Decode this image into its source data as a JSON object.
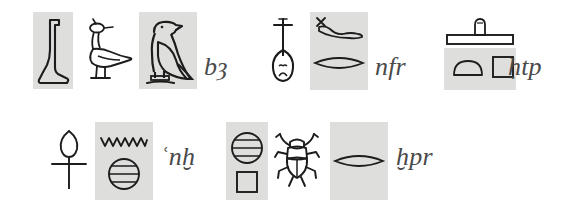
{
  "page": {
    "background_color": "#ffffff",
    "shade_color": "#dededd",
    "ink_color": "#1c1c1c",
    "translit_color": "#4a4a4a",
    "width": 570,
    "height": 210
  },
  "rows": [
    {
      "id": "row-top",
      "groups": [
        {
          "id": "group-ba",
          "transliteration": "bȜ",
          "translit_display": "bȝ",
          "translit_font_size": 26,
          "signs": [
            {
              "id": "sign-foot",
              "name": "foot-glyph",
              "phonetic": "b",
              "shaded": true
            },
            {
              "id": "sign-heron",
              "name": "heron-bird-glyph",
              "phonetic": "ȝ",
              "shaded": false
            },
            {
              "id": "sign-ba-bird",
              "name": "ba-bird-glyph",
              "phonetic": "bȝ",
              "shaded": true
            }
          ]
        },
        {
          "id": "group-nefer",
          "transliteration": "nfr",
          "translit_display": "nfr",
          "translit_font_size": 26,
          "signs": [
            {
              "id": "sign-nefer",
              "name": "heart-windpipe-glyph",
              "phonetic": "nfr",
              "shaded": false
            },
            {
              "id": "sign-viper",
              "name": "horned-viper-glyph",
              "phonetic": "f",
              "shaded": true
            },
            {
              "id": "sign-mouth-1",
              "name": "mouth-glyph",
              "phonetic": "r",
              "shaded": true
            }
          ]
        },
        {
          "id": "group-hetep",
          "transliteration": "ḥtp",
          "translit_display": "ḥtp",
          "translit_font_size": 26,
          "signs": [
            {
              "id": "sign-offering-mat",
              "name": "offering-mat-with-loaf-glyph",
              "phonetic": "ḥtp",
              "shaded": false
            },
            {
              "id": "sign-bread-t",
              "name": "bread-loaf-glyph",
              "phonetic": "t",
              "shaded": true
            },
            {
              "id": "sign-stool-p",
              "name": "reed-mat-stool-glyph",
              "phonetic": "p",
              "shaded": true
            }
          ]
        }
      ]
    },
    {
      "id": "row-bottom",
      "groups": [
        {
          "id": "group-ankh",
          "transliteration": "ʿnḫ",
          "translit_display": "ʿnḫ",
          "translit_font_size": 26,
          "signs": [
            {
              "id": "sign-ankh",
              "name": "ankh-glyph",
              "phonetic": "ʿnḫ",
              "shaded": false
            },
            {
              "id": "sign-water",
              "name": "water-ripple-glyph",
              "phonetic": "n",
              "shaded": true
            },
            {
              "id": "sign-placenta-1",
              "name": "placenta-glyph",
              "phonetic": "ḫ",
              "shaded": true
            }
          ]
        },
        {
          "id": "group-kheper",
          "transliteration": "ḫpr",
          "translit_display": "ḫpr",
          "translit_font_size": 26,
          "signs": [
            {
              "id": "sign-placenta-2",
              "name": "placenta-glyph",
              "phonetic": "ḫ",
              "shaded": true
            },
            {
              "id": "sign-stool-p-2",
              "name": "reed-mat-stool-glyph",
              "phonetic": "p",
              "shaded": true
            },
            {
              "id": "sign-scarab",
              "name": "scarab-beetle-glyph",
              "phonetic": "ḫpr",
              "shaded": false
            },
            {
              "id": "sign-mouth-2",
              "name": "mouth-glyph",
              "phonetic": "r",
              "shaded": true
            }
          ]
        }
      ]
    }
  ]
}
